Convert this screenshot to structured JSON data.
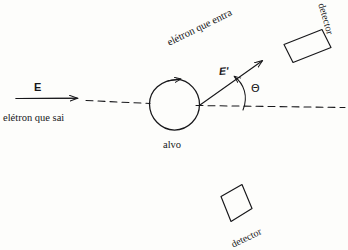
{
  "figure": {
    "kind": "scattering-diagram",
    "background_color": "#fdfdfb",
    "ink_color": "#17171a"
  },
  "labels": {
    "incoming_energy": "E",
    "incoming_electron": "elétron que sai",
    "scattered_energy": "E'",
    "scattered_electron": "elétron que entra",
    "target": "alvo",
    "angle": "Θ",
    "detector_top": "detector",
    "detector_bottom": "detector"
  },
  "elements": {
    "beam_arrow": "solid-arrow-right",
    "axis": "dashed-horizontal-axis",
    "target_circle": "open-circle",
    "scatter_arrow": "solid-arrow-upper-right",
    "angle_arc": "arc-between-axis-and-scatter-arrow",
    "detector_top_box": "tilted-rectangle",
    "detector_bottom_box": "tilted-rectangle"
  }
}
